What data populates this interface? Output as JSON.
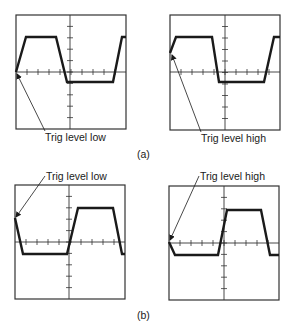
{
  "figure": {
    "panels": [
      {
        "id": "a",
        "caption": "(a)",
        "scopes": [
          {
            "label": "Trig level low",
            "trigger_level": "low",
            "box": {
              "x": 16,
              "y": 15,
              "w": 110,
              "h": 114
            },
            "axis_y": 72,
            "center_x": 70,
            "waveform": [
              [
                16,
                72
              ],
              [
                26,
                37
              ],
              [
                56,
                37
              ],
              [
                67,
                82
              ],
              [
                113,
                82
              ],
              [
                122,
                37
              ],
              [
                126,
                37
              ]
            ],
            "arrow": {
              "from": [
                45,
                131
              ],
              "to": [
                17,
                74
              ]
            },
            "label_pos": {
              "x": 45,
              "y": 132
            }
          },
          {
            "label": "Trig level high",
            "trigger_level": "high",
            "box": {
              "x": 170,
              "y": 15,
              "w": 110,
              "h": 115
            },
            "axis_y": 72,
            "center_x": 225,
            "waveform": [
              [
                170,
                53
              ],
              [
                176,
                37
              ],
              [
                212,
                37
              ],
              [
                219,
                82
              ],
              [
                264,
                82
              ],
              [
                274,
                37
              ],
              [
                280,
                37
              ]
            ],
            "arrow": {
              "from": [
                201,
                132
              ],
              "to": [
                172,
                55
              ]
            },
            "label_pos": {
              "x": 201,
              "y": 133
            }
          }
        ]
      },
      {
        "id": "b",
        "caption": "(b)",
        "scopes": [
          {
            "label": "Trig level low",
            "trigger_level": "low",
            "box": {
              "x": 15,
              "y": 185,
              "w": 110,
              "h": 114
            },
            "axis_y": 242,
            "center_x": 69,
            "waveform": [
              [
                15,
                218
              ],
              [
                23,
                254
              ],
              [
                67,
                254
              ],
              [
                78,
                208
              ],
              [
                113,
                208
              ],
              [
                122,
                254
              ],
              [
                125,
                254
              ]
            ],
            "arrow": {
              "from": [
                45,
                176
              ],
              "to": [
                16,
                217
              ]
            },
            "label_pos": {
              "x": 46,
              "y": 171
            }
          },
          {
            "label": "Trig level high",
            "trigger_level": "high",
            "box": {
              "x": 169,
              "y": 186,
              "w": 110,
              "h": 114
            },
            "axis_y": 243,
            "center_x": 224,
            "waveform": [
              [
                169,
                242
              ],
              [
                175,
                255
              ],
              [
                218,
                255
              ],
              [
                227,
                210
              ],
              [
                261,
                210
              ],
              [
                270,
                255
              ],
              [
                279,
                255
              ]
            ],
            "arrow": {
              "from": [
                199,
                176
              ],
              "to": [
                170,
                240
              ]
            },
            "label_pos": {
              "x": 200,
              "y": 171
            }
          }
        ]
      }
    ],
    "caption_positions": {
      "a": {
        "x": 137,
        "y": 149
      },
      "b": {
        "x": 137,
        "y": 310
      }
    },
    "colors": {
      "ink": "#1a1a1a",
      "grid": "#333333",
      "background": "#ffffff"
    },
    "divisions": 10
  }
}
